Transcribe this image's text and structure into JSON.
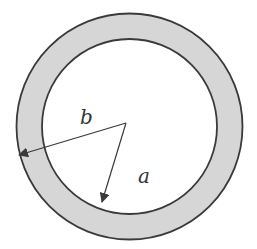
{
  "diagram": {
    "labels": {
      "inner_radius": "a",
      "outer_radius": "b"
    },
    "colors": {
      "ring_fill": "#d6d6d6",
      "stroke": "#3a3a3a",
      "background": "#ffffff"
    }
  }
}
